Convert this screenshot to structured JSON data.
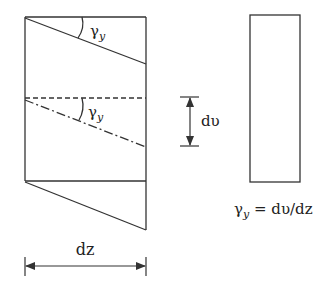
{
  "diagram": {
    "labels": {
      "gamma_top": "γ",
      "gamma_top_sub": "y",
      "gamma_mid": "γ",
      "gamma_mid_sub": "y",
      "dv": "dυ",
      "dz": "dz",
      "formula_gamma": "γ",
      "formula_sub": "y",
      "formula_rhs": " = dυ/dz"
    },
    "colors": {
      "stroke": "#333333",
      "background": "#ffffff"
    }
  }
}
